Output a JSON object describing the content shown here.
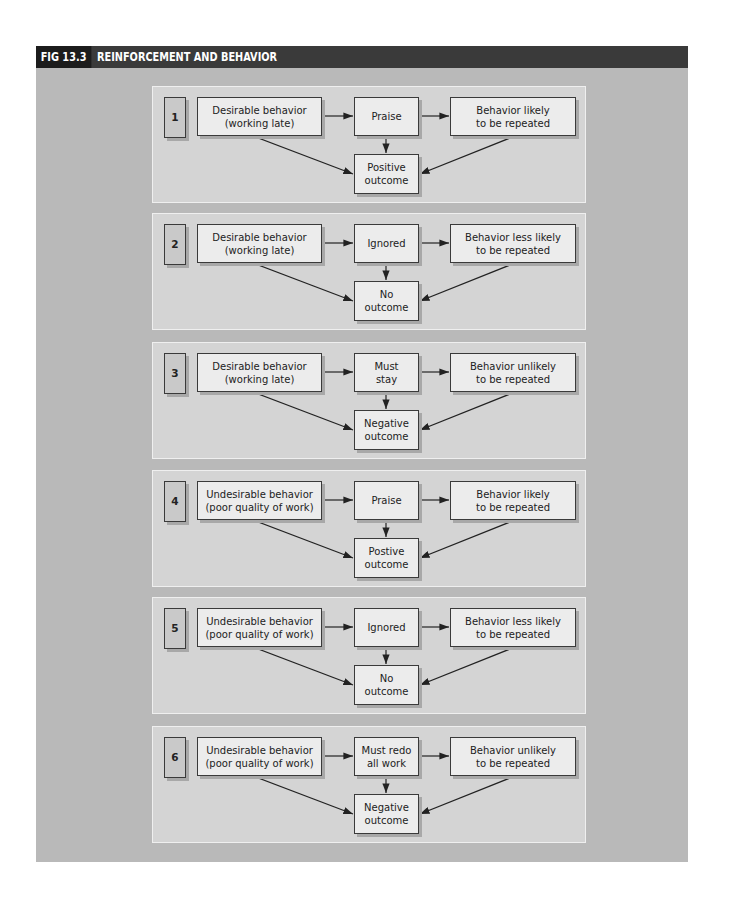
{
  "figure": {
    "number": "FIG 13.3",
    "title": "REINFORCEMENT AND BEHAVIOR"
  },
  "panels": [
    {
      "number": "1",
      "behavior": "Desirable behavior\n(working late)",
      "response": "Praise",
      "result": "Behavior likely\nto be repeated",
      "outcome": "Positive\noutcome"
    },
    {
      "number": "2",
      "behavior": "Desirable behavior\n(working late)",
      "response": "Ignored",
      "result": "Behavior less likely\nto be repeated",
      "outcome": "No\noutcome"
    },
    {
      "number": "3",
      "behavior": "Desirable behavior\n(working late)",
      "response": "Must\nstay",
      "result": "Behavior unlikely\nto be repeated",
      "outcome": "Negative\noutcome"
    },
    {
      "number": "4",
      "behavior": "Undesirable behavior\n(poor quality of work)",
      "response": "Praise",
      "result": "Behavior likely\nto be repeated",
      "outcome": "Postive\noutcome"
    },
    {
      "number": "5",
      "behavior": "Undesirable behavior\n(poor quality of work)",
      "response": "Ignored",
      "result": "Behavior less likely\nto be repeated",
      "outcome": "No\noutcome"
    },
    {
      "number": "6",
      "behavior": "Undesirable behavior\n(poor quality of work)",
      "response": "Must redo\nall work",
      "result": "Behavior unlikely\nto be repeated",
      "outcome": "Negative\noutcome"
    }
  ],
  "colors": {
    "header_bg": "#3a3a3a",
    "header_label_bg": "#1c1c1c",
    "figure_bg": "#b9b9b9",
    "panel_bg": "#d4d4d4",
    "box_bg": "#ececec"
  }
}
